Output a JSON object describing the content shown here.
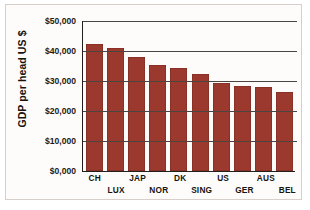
{
  "chart_data": {
    "type": "bar",
    "title": "",
    "xlabel": "",
    "ylabel": "GDP per head US $",
    "ylim": [
      0,
      50000
    ],
    "grid": true,
    "legend": null,
    "ytick_labels": [
      "$50,000",
      "$40,000",
      "$30,000",
      "$20,000",
      "$10,000",
      "$0,000"
    ],
    "ytick_values": [
      50000,
      40000,
      30000,
      20000,
      10000,
      0
    ],
    "categories": [
      "CH",
      "LUX",
      "JAP",
      "NOR",
      "DK",
      "SING",
      "US",
      "GER",
      "AUS",
      "BEL"
    ],
    "values": [
      42500,
      41000,
      38000,
      35500,
      34500,
      32500,
      29500,
      28500,
      28000,
      26500
    ],
    "bar_color": "#9c392e",
    "axis_color": "#231f1c",
    "grid_color": "#4a4541",
    "background_color": "#fdfcfa"
  }
}
